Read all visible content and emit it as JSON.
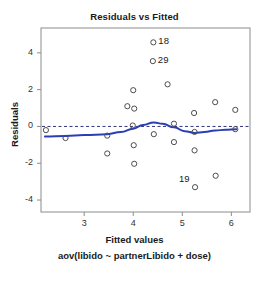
{
  "chart_data": {
    "type": "scatter",
    "title": "Residuals vs Fitted",
    "xlabel": "Fitted values",
    "sub_xlabel": "aov(libido ~ partnerLibido + dose)",
    "ylabel": "Residuals",
    "xlim": [
      2.12,
      6.38
    ],
    "ylim": [
      -4.65,
      5.35
    ],
    "xticks": [
      3,
      4,
      5,
      6
    ],
    "yticks": [
      4,
      2,
      0,
      -2,
      -4
    ],
    "grid": false,
    "legend": null,
    "zero_reference_line": {
      "y": 0,
      "style": "dashed",
      "color": "#33337f"
    },
    "colors": {
      "point": "#4d4d4d",
      "loess": "#2b3fb5",
      "refline": "#33337f",
      "frame": "#8c8c8c",
      "text": "#1a1a1a"
    },
    "points": [
      {
        "x": 2.22,
        "y": -0.2
      },
      {
        "x": 2.62,
        "y": -0.63
      },
      {
        "x": 3.47,
        "y": -0.5
      },
      {
        "x": 3.47,
        "y": -1.47
      },
      {
        "x": 3.88,
        "y": 1.1
      },
      {
        "x": 4.0,
        "y": 1.97
      },
      {
        "x": 4.02,
        "y": 0.97
      },
      {
        "x": 3.99,
        "y": 0.05
      },
      {
        "x": 4.01,
        "y": -1.02
      },
      {
        "x": 4.02,
        "y": -2.03
      },
      {
        "x": 4.41,
        "y": 4.57
      },
      {
        "x": 4.4,
        "y": 3.55
      },
      {
        "x": 4.42,
        "y": -0.42
      },
      {
        "x": 4.7,
        "y": 2.29
      },
      {
        "x": 4.83,
        "y": 0.15
      },
      {
        "x": 4.83,
        "y": -0.85
      },
      {
        "x": 5.24,
        "y": 0.73
      },
      {
        "x": 5.25,
        "y": -0.3
      },
      {
        "x": 5.25,
        "y": -1.3
      },
      {
        "x": 5.26,
        "y": -3.3
      },
      {
        "x": 5.67,
        "y": 1.32
      },
      {
        "x": 5.68,
        "y": -2.68
      },
      {
        "x": 6.08,
        "y": 0.9
      },
      {
        "x": 6.08,
        "y": -0.15
      }
    ],
    "labeled_points": [
      {
        "label": "18",
        "x": 4.41,
        "y": 4.57
      },
      {
        "label": "29",
        "x": 4.4,
        "y": 3.55
      },
      {
        "label": "19",
        "x": 5.26,
        "y": -3.3
      }
    ],
    "loess_curve": [
      {
        "x": 2.2,
        "y": -0.55
      },
      {
        "x": 2.62,
        "y": -0.52
      },
      {
        "x": 3.0,
        "y": -0.47
      },
      {
        "x": 3.47,
        "y": -0.42
      },
      {
        "x": 3.75,
        "y": -0.3
      },
      {
        "x": 4.0,
        "y": -0.12
      },
      {
        "x": 4.2,
        "y": 0.08
      },
      {
        "x": 4.42,
        "y": 0.22
      },
      {
        "x": 4.6,
        "y": 0.14
      },
      {
        "x": 4.83,
        "y": -0.05
      },
      {
        "x": 5.05,
        "y": -0.26
      },
      {
        "x": 5.25,
        "y": -0.35
      },
      {
        "x": 5.45,
        "y": -0.3
      },
      {
        "x": 5.67,
        "y": -0.22
      },
      {
        "x": 5.88,
        "y": -0.18
      },
      {
        "x": 6.1,
        "y": -0.15
      }
    ]
  }
}
